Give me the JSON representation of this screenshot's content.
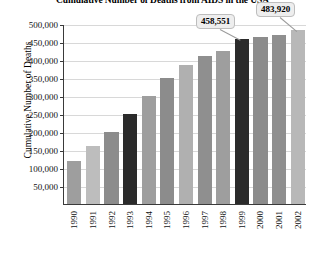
{
  "chart_data": {
    "type": "bar",
    "title": "Cumulative Number of Deaths from AIDS in the USA",
    "xlabel": "",
    "ylabel": "Cumulative Number of Deaths",
    "categories": [
      "1990",
      "1991",
      "1992",
      "1993",
      "1994",
      "1995",
      "1996",
      "1997",
      "1998",
      "1999",
      "2000",
      "2001",
      "2002"
    ],
    "values": [
      120000,
      160000,
      200000,
      250000,
      300000,
      350000,
      385000,
      410000,
      425000,
      458551,
      465000,
      470000,
      483920
    ],
    "ylim": [
      0,
      500000
    ],
    "ytick_labels": [
      "50,000",
      "100,000",
      "150,000",
      "200,000",
      "250,000",
      "300,000",
      "350,000",
      "400,000",
      "450,000",
      "500,000"
    ],
    "ytick_values": [
      50000,
      100000,
      150000,
      200000,
      250000,
      300000,
      350000,
      400000,
      450000,
      500000
    ],
    "grid": true,
    "legend": "none",
    "bar_colors": [
      "#9e9e9e",
      "#bdbdbd",
      "#8c8c8c",
      "#2b2b2b",
      "#9e9e9e",
      "#8c8c8c",
      "#b0b0b0",
      "#8f8f8f",
      "#9e9e9e",
      "#2b2b2b",
      "#8c8c8c",
      "#8f8f8f",
      "#b8b8b8"
    ],
    "annotations": [
      {
        "label": "458,551",
        "category": "1999",
        "value": 458551
      },
      {
        "label": "483,920",
        "category": "2002",
        "value": 483920
      }
    ]
  }
}
